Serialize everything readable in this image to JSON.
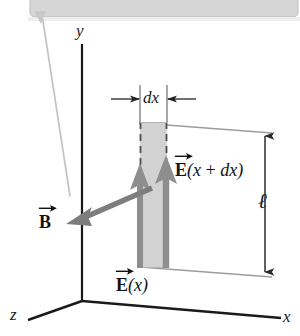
{
  "figure": {
    "kind": "physics-diagram",
    "background_color": "#ffffff",
    "axes": {
      "y_label": "y",
      "x_label": "x",
      "z_label": "z",
      "color": "#1a1a1a"
    },
    "labels": {
      "b_field": {
        "letter": "B",
        "args": "",
        "icon": "vector-arrow-overbar"
      },
      "e_field_x": {
        "letter": "E",
        "args": "(x)",
        "icon": "vector-arrow-overbar"
      },
      "e_field_x_plus_dx": {
        "letter": "E",
        "args_open": "(x",
        "plus": " + ",
        "args_close": "dx)",
        "icon": "vector-arrow-overbar"
      },
      "dx": "dx",
      "length": "ℓ"
    },
    "colors": {
      "slab_fill": "#d2d2d2",
      "slab_edge": "#555555",
      "field_arrow": "#8e8e8e",
      "b_arrow": "#7d7d7d",
      "axis": "#1a1a1a",
      "dimension_line": "#9a9a9a",
      "scan_band": "#d7d7d7",
      "scan_leader": "#c2c2c2"
    }
  }
}
